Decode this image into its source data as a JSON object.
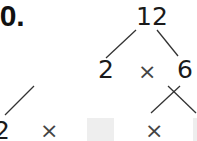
{
  "problem": {
    "label": "10.",
    "tree": {
      "root": "12",
      "level1": {
        "left": "2",
        "operator": "×",
        "right": "6"
      },
      "level2": {
        "left": "2",
        "operator1": "×",
        "box1": "",
        "operator2": "×",
        "box2": ""
      }
    }
  },
  "colors": {
    "text": "#1a1a1a",
    "line": "#333333",
    "answer_box": "#eeeeee"
  }
}
